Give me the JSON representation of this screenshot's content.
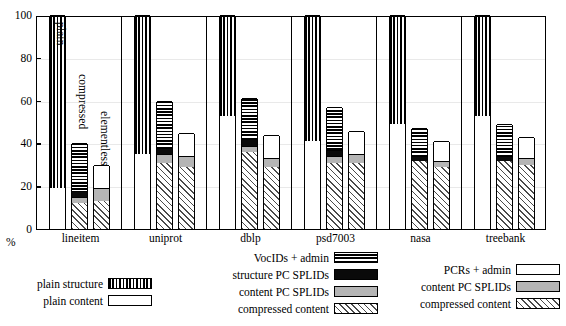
{
  "chart_data": {
    "type": "bar",
    "subtype": "grouped-stacked-bar",
    "title": "",
    "xlabel": "",
    "ylabel": "%",
    "ylim": [
      0,
      100
    ],
    "yticks": [
      0,
      20,
      40,
      60,
      80,
      100
    ],
    "ytick_labels": [
      "0",
      "20",
      "40",
      "60",
      "80",
      "100"
    ],
    "grid": true,
    "legend_position": "below-plot",
    "categories": [
      "lineitem",
      "uniprot",
      "dblp",
      "psd7003",
      "nasa",
      "treebank"
    ],
    "bar_variants": [
      "plain",
      "compressed",
      "elementless"
    ],
    "in_plot_annotations": [
      "plain",
      "compressed",
      "elementless"
    ],
    "segment_names": {
      "plain_structure": "plain structure",
      "plain_content": "plain content",
      "vocids_admin": "VocIDs + admin",
      "structure_pc_splids": "structure PC SPLIDs",
      "content_pc_splids": "content PC SPLIDs",
      "compressed_content": "compressed content",
      "pcrs_admin": "PCRs + admin"
    },
    "series": [
      {
        "name": "plain structure",
        "bar": "plain",
        "values": [
          81,
          65,
          47,
          59,
          51,
          47
        ]
      },
      {
        "name": "plain content",
        "bar": "plain",
        "values": [
          19,
          35,
          53,
          41,
          49,
          53
        ]
      },
      {
        "name": "VocIDs + admin",
        "bar": "compressed",
        "values": [
          22,
          22,
          19,
          20,
          13,
          15
        ]
      },
      {
        "name": "structure PC SPLIDs",
        "bar": "compressed",
        "values": [
          3,
          3,
          3,
          3,
          2,
          2
        ]
      },
      {
        "name": "content PC SPLIDs",
        "bar": "compressed",
        "values": [
          3,
          4,
          3,
          3,
          0,
          0
        ]
      },
      {
        "name": "compressed content",
        "bar": "compressed",
        "values": [
          12,
          31,
          36,
          31,
          32,
          32
        ]
      },
      {
        "name": "PCRs + admin",
        "bar": "elementless",
        "values": [
          11,
          11,
          11,
          11,
          9,
          10
        ]
      },
      {
        "name": "content PC SPLIDs",
        "bar": "elementless",
        "values": [
          6,
          5,
          4,
          4,
          3,
          3
        ]
      },
      {
        "name": "compressed content",
        "bar": "elementless",
        "values": [
          13,
          29,
          29,
          31,
          29,
          30
        ]
      }
    ],
    "group_totals": {
      "plain": [
        100,
        100,
        100,
        100,
        100,
        100
      ],
      "compressed": [
        40,
        60,
        61,
        57,
        47,
        49
      ],
      "elementless": [
        30,
        45,
        44,
        46,
        41,
        43
      ]
    }
  },
  "axis": {
    "unit_label": "%",
    "ticks": [
      "100",
      "80",
      "60",
      "40",
      "20",
      "0"
    ]
  },
  "legend": {
    "left": {
      "items": [
        {
          "label": "plain structure",
          "pattern": "vertical-stripes"
        },
        {
          "label": "plain content",
          "pattern": "white"
        }
      ]
    },
    "middle": {
      "items": [
        {
          "label": "VocIDs + admin",
          "pattern": "horizontal-stripes"
        },
        {
          "label": "structure PC SPLIDs",
          "pattern": "black"
        },
        {
          "label": "content PC SPLIDs",
          "pattern": "gray"
        },
        {
          "label": "compressed content",
          "pattern": "diagonal-hatch"
        }
      ]
    },
    "right": {
      "items": [
        {
          "label": "PCRs + admin",
          "pattern": "white"
        },
        {
          "label": "content PC SPLIDs",
          "pattern": "gray"
        },
        {
          "label": "compressed content",
          "pattern": "diagonal-hatch"
        }
      ]
    }
  },
  "colors": {
    "black": "#0a0a0a",
    "gray": "#b5b5b5",
    "white": "#ffffff",
    "axis": "#000000",
    "grid": "#e9e9e9"
  }
}
